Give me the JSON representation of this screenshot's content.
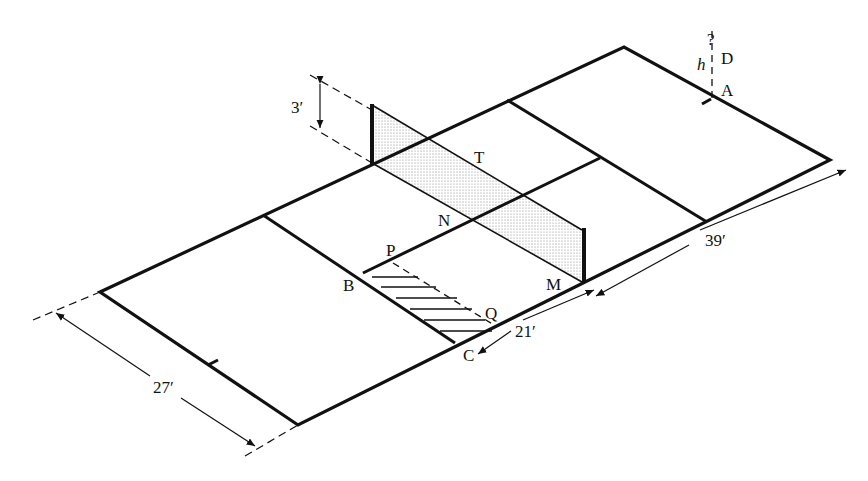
{
  "figure": {
    "type": "court-diagram",
    "colors": {
      "line": "#111111",
      "net_fill": "#d9d9d9",
      "hatch": "#222222",
      "background": "#ffffff"
    }
  },
  "labels": {
    "A": "A",
    "D": "D",
    "h": "h",
    "question": "?",
    "T": "T",
    "N": "N",
    "P": "P",
    "B": "B",
    "M": "M",
    "Q": "Q",
    "C": "C"
  },
  "dimensions": {
    "net_height": "3′",
    "width": "27′",
    "service_length": "21′",
    "half_length": "39′"
  }
}
